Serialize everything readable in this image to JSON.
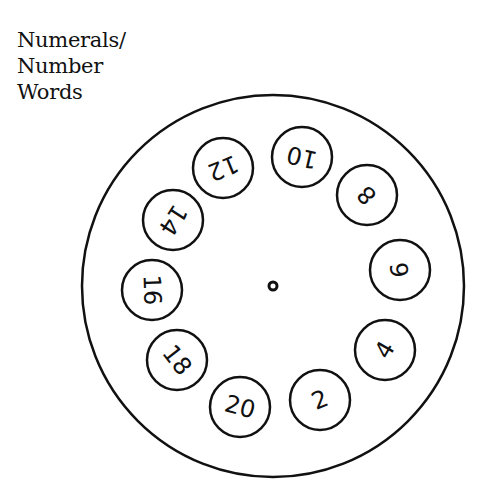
{
  "title": {
    "lines": [
      "Numerals/",
      "Number",
      "Words"
    ]
  },
  "wheel": {
    "center": {
      "x": 273,
      "y": 286
    },
    "outer_radius": 191,
    "inner_circle_radius": 30,
    "center_hole_radius": 4,
    "stroke_color": "#111111",
    "numbers": [
      {
        "label": "10",
        "x": 302,
        "y": 157,
        "rotate": 193
      },
      {
        "label": "8",
        "x": 367,
        "y": 195,
        "rotate": 226
      },
      {
        "label": "6",
        "x": 400,
        "y": 270,
        "rotate": 263
      },
      {
        "label": "4",
        "x": 385,
        "y": 350,
        "rotate": 300
      },
      {
        "label": "2",
        "x": 320,
        "y": 400,
        "rotate": 337
      },
      {
        "label": "20",
        "x": 240,
        "y": 407,
        "rotate": 15
      },
      {
        "label": "18",
        "x": 177,
        "y": 360,
        "rotate": 52
      },
      {
        "label": "16",
        "x": 152,
        "y": 290,
        "rotate": 88
      },
      {
        "label": "14",
        "x": 173,
        "y": 220,
        "rotate": 123
      },
      {
        "label": "12",
        "x": 223,
        "y": 168,
        "rotate": 158
      }
    ]
  }
}
